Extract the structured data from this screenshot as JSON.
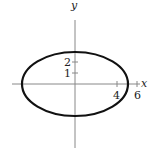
{
  "diagram": {
    "type": "ellipse-graph",
    "axes": {
      "x_label": "x",
      "y_label": "y",
      "x_ticks": [
        {
          "value": 4,
          "label": "4"
        },
        {
          "value": 6,
          "label": "6"
        }
      ],
      "y_ticks": [
        {
          "value": 1,
          "label": "1"
        },
        {
          "value": 2,
          "label": "2"
        }
      ]
    },
    "ellipse": {
      "center": [
        0,
        0
      ],
      "semi_axis_x": 5,
      "semi_axis_y": 3
    },
    "colors": {
      "curve": "#111111",
      "axis": "#888888",
      "text": "#222222"
    }
  }
}
